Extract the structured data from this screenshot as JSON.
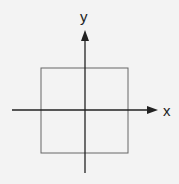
{
  "diagram": {
    "type": "coordinate-axes-with-square",
    "x_axis_label": "x",
    "y_axis_label": "y",
    "colors": {
      "background": "#f3f3f3",
      "axis": "#222222",
      "square": "#666666"
    }
  }
}
